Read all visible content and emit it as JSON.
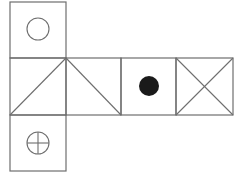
{
  "diagram": {
    "type": "cube-net",
    "colors": {
      "line": "#6e6e6e",
      "fill_dot": "#1a1a1a",
      "background": "#ffffff"
    },
    "faces": [
      {
        "id": "top",
        "position": "above first column",
        "symbol": "hollow-circle"
      },
      {
        "id": "row-1",
        "position": "middle row, column 1",
        "symbol": "diagonal-bottom-left-to-top-right"
      },
      {
        "id": "row-2",
        "position": "middle row, column 2",
        "symbol": "diagonal-top-left-to-bottom-right"
      },
      {
        "id": "row-3",
        "position": "middle row, column 3",
        "symbol": "filled-circle"
      },
      {
        "id": "row-4",
        "position": "middle row, column 4",
        "symbol": "x-cross"
      },
      {
        "id": "bottom",
        "position": "below first column",
        "symbol": "circle-with-cross"
      }
    ]
  }
}
